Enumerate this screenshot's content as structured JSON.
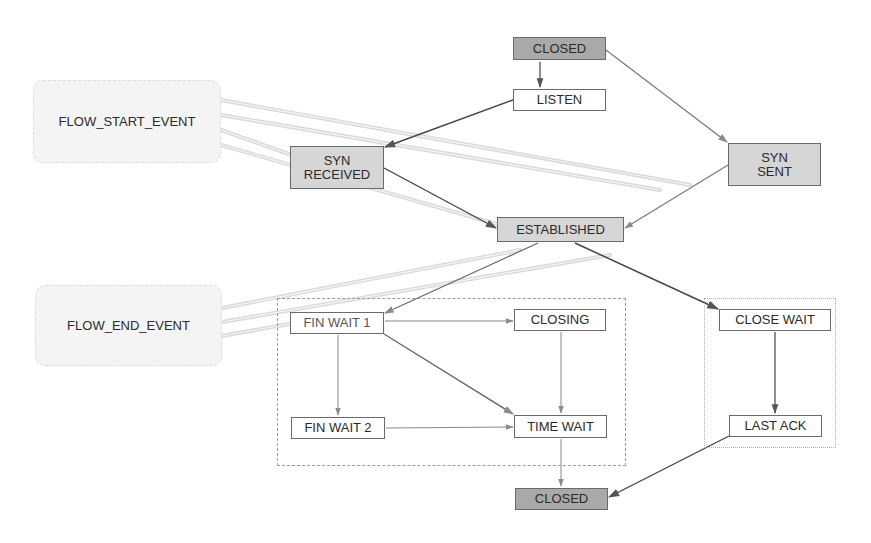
{
  "diagram": {
    "colors": {
      "background": "#ffffff",
      "dark_state": "#a9a9a9",
      "mid_state": "#d6d6d6",
      "light_state": "#ffffff",
      "edge": "#555555",
      "event_band": "#d8d8d8"
    },
    "events": [
      {
        "id": "flow_start",
        "label": "FLOW_START_EVENT"
      },
      {
        "id": "flow_end",
        "label": "FLOW_END_EVENT"
      }
    ],
    "states": [
      {
        "id": "closed_top",
        "label": "CLOSED"
      },
      {
        "id": "listen",
        "label": "LISTEN"
      },
      {
        "id": "syn_received",
        "label_line1": "SYN",
        "label_line2": "RECEIVED"
      },
      {
        "id": "syn_sent",
        "label_line1": "SYN",
        "label_line2": "SENT"
      },
      {
        "id": "established",
        "label": "ESTABLISHED"
      },
      {
        "id": "fin_wait_1",
        "label": "FIN WAIT 1"
      },
      {
        "id": "closing",
        "label": "CLOSING"
      },
      {
        "id": "fin_wait_2",
        "label": "FIN WAIT 2"
      },
      {
        "id": "time_wait",
        "label": "TIME WAIT"
      },
      {
        "id": "close_wait",
        "label": "CLOSE WAIT"
      },
      {
        "id": "last_ack",
        "label": "LAST ACK"
      },
      {
        "id": "closed_bottom",
        "label": "CLOSED"
      }
    ],
    "groups": [
      {
        "id": "active_close",
        "members": [
          "FIN WAIT 1",
          "CLOSING",
          "FIN WAIT 2",
          "TIME WAIT"
        ]
      },
      {
        "id": "passive_close",
        "members": [
          "CLOSE WAIT",
          "LAST ACK"
        ]
      }
    ],
    "transitions": [
      {
        "from": "CLOSED",
        "to": "LISTEN"
      },
      {
        "from": "CLOSED",
        "to": "SYN SENT"
      },
      {
        "from": "LISTEN",
        "to": "SYN RECEIVED"
      },
      {
        "from": "SYN RECEIVED",
        "to": "ESTABLISHED"
      },
      {
        "from": "SYN SENT",
        "to": "ESTABLISHED"
      },
      {
        "from": "ESTABLISHED",
        "to": "FIN WAIT 1"
      },
      {
        "from": "ESTABLISHED",
        "to": "CLOSE WAIT"
      },
      {
        "from": "FIN WAIT 1",
        "to": "CLOSING"
      },
      {
        "from": "FIN WAIT 1",
        "to": "FIN WAIT 2"
      },
      {
        "from": "FIN WAIT 1",
        "to": "TIME WAIT"
      },
      {
        "from": "CLOSING",
        "to": "TIME WAIT"
      },
      {
        "from": "FIN WAIT 2",
        "to": "TIME WAIT"
      },
      {
        "from": "TIME WAIT",
        "to": "CLOSED"
      },
      {
        "from": "CLOSE WAIT",
        "to": "LAST ACK"
      },
      {
        "from": "LAST ACK",
        "to": "CLOSED"
      }
    ],
    "event_links": [
      {
        "event": "FLOW_START_EVENT",
        "targets": [
          "SYN RECEIVED",
          "ESTABLISHED",
          "SYN SENT"
        ]
      },
      {
        "event": "FLOW_END_EVENT",
        "targets": [
          "FIN WAIT 1",
          "ESTABLISHED"
        ]
      }
    ]
  }
}
